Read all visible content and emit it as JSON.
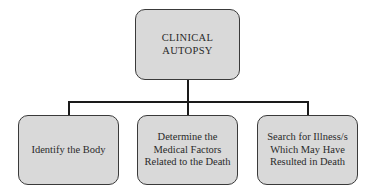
{
  "diagram": {
    "type": "hierarchy",
    "root": {
      "label_lines": [
        "CLINICAL",
        "AUTOPSY"
      ]
    },
    "children": [
      {
        "label_lines": [
          "Identify the Body"
        ]
      },
      {
        "label_lines": [
          "Determine the",
          "Medical Factors",
          "Related to the Death"
        ]
      },
      {
        "label_lines": [
          "Search for Illness/s",
          "Which May Have",
          "Resulted in Death"
        ]
      }
    ],
    "colors": {
      "box_fill": "#d9d9d9",
      "box_border": "#3a3a3a",
      "connector": "#1a1a1a",
      "text": "#2a2a2a"
    }
  }
}
